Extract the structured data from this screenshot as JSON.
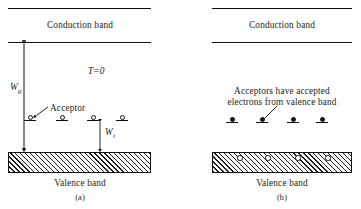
{
  "figure": {
    "panel_a": {
      "conduction_band_label": "Conduction band",
      "temperature_label": "T=0",
      "gap_label": "W",
      "gap_label_sub": "g",
      "acceptor_label": "Acceptor",
      "ionization_label": "W",
      "ionization_label_sub": "i",
      "valence_band_label": "Valence band",
      "caption": "(a)",
      "acceptor_states": [
        {
          "x": 30,
          "y": 120,
          "filled": false
        },
        {
          "x": 62,
          "y": 120,
          "filled": false
        },
        {
          "x": 93,
          "y": 120,
          "filled": false
        },
        {
          "x": 122,
          "y": 120,
          "filled": false
        }
      ],
      "valence_holes": []
    },
    "panel_b": {
      "conduction_band_label": "Conduction band",
      "annotation_line_1": "Acceptors have accepted",
      "annotation_line_2": "electrons from valence band",
      "valence_band_label": "Valence band",
      "caption": "(b)",
      "acceptor_states": [
        {
          "x": 232,
          "y": 122,
          "filled": true
        },
        {
          "x": 262,
          "y": 122,
          "filled": true
        },
        {
          "x": 293,
          "y": 122,
          "filled": true
        },
        {
          "x": 322,
          "y": 122,
          "filled": true
        }
      ],
      "valence_holes": [
        {
          "x": 240,
          "y": 158
        },
        {
          "x": 268,
          "y": 158
        },
        {
          "x": 298,
          "y": 158
        },
        {
          "x": 328,
          "y": 158
        }
      ]
    },
    "colors": {
      "ink": "#111111",
      "background": "#ffffff"
    }
  }
}
